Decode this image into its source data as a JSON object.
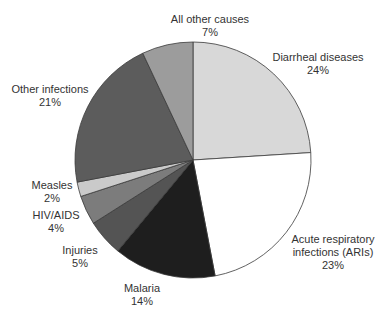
{
  "chart_data": {
    "type": "pie",
    "title": "",
    "start_angle_deg": 0,
    "direction": "clockwise",
    "slices": [
      {
        "label": "Diarrheal diseases",
        "value": 24,
        "display": "24%",
        "color": "#d8d8d8"
      },
      {
        "label": "Acute respiratory infections (ARIs)",
        "value": 23,
        "display": "23%",
        "color": "#ffffff"
      },
      {
        "label": "Malaria",
        "value": 14,
        "display": "14%",
        "color": "#1e1e1e"
      },
      {
        "label": "Injuries",
        "value": 5,
        "display": "5%",
        "color": "#545454"
      },
      {
        "label": "HIV/AIDS",
        "value": 4,
        "display": "4%",
        "color": "#7c7c7c"
      },
      {
        "label": "Measles",
        "value": 2,
        "display": "2%",
        "color": "#cacaca"
      },
      {
        "label": "Other infections",
        "value": 21,
        "display": "21%",
        "color": "#5c5c5c"
      },
      {
        "label": "All other causes",
        "value": 7,
        "display": "7%",
        "color": "#9c9c9c"
      }
    ],
    "legend": "none (direct labels)"
  },
  "labels": {
    "diarrheal": {
      "line1": "Diarrheal diseases",
      "line2": "24%"
    },
    "aris": {
      "line1": "Acute respiratory",
      "line2": "infections (ARIs)",
      "line3": "23%"
    },
    "malaria": {
      "line1": "Malaria",
      "line2": "14%"
    },
    "injuries": {
      "line1": "Injuries",
      "line2": "5%"
    },
    "hiv": {
      "line1": "HIV/AIDS",
      "line2": "4%"
    },
    "measles": {
      "line1": "Measles",
      "line2": "2%"
    },
    "other_infections": {
      "line1": "Other infections",
      "line2": "21%"
    },
    "all_other": {
      "line1": "All other causes",
      "line2": "7%"
    }
  }
}
